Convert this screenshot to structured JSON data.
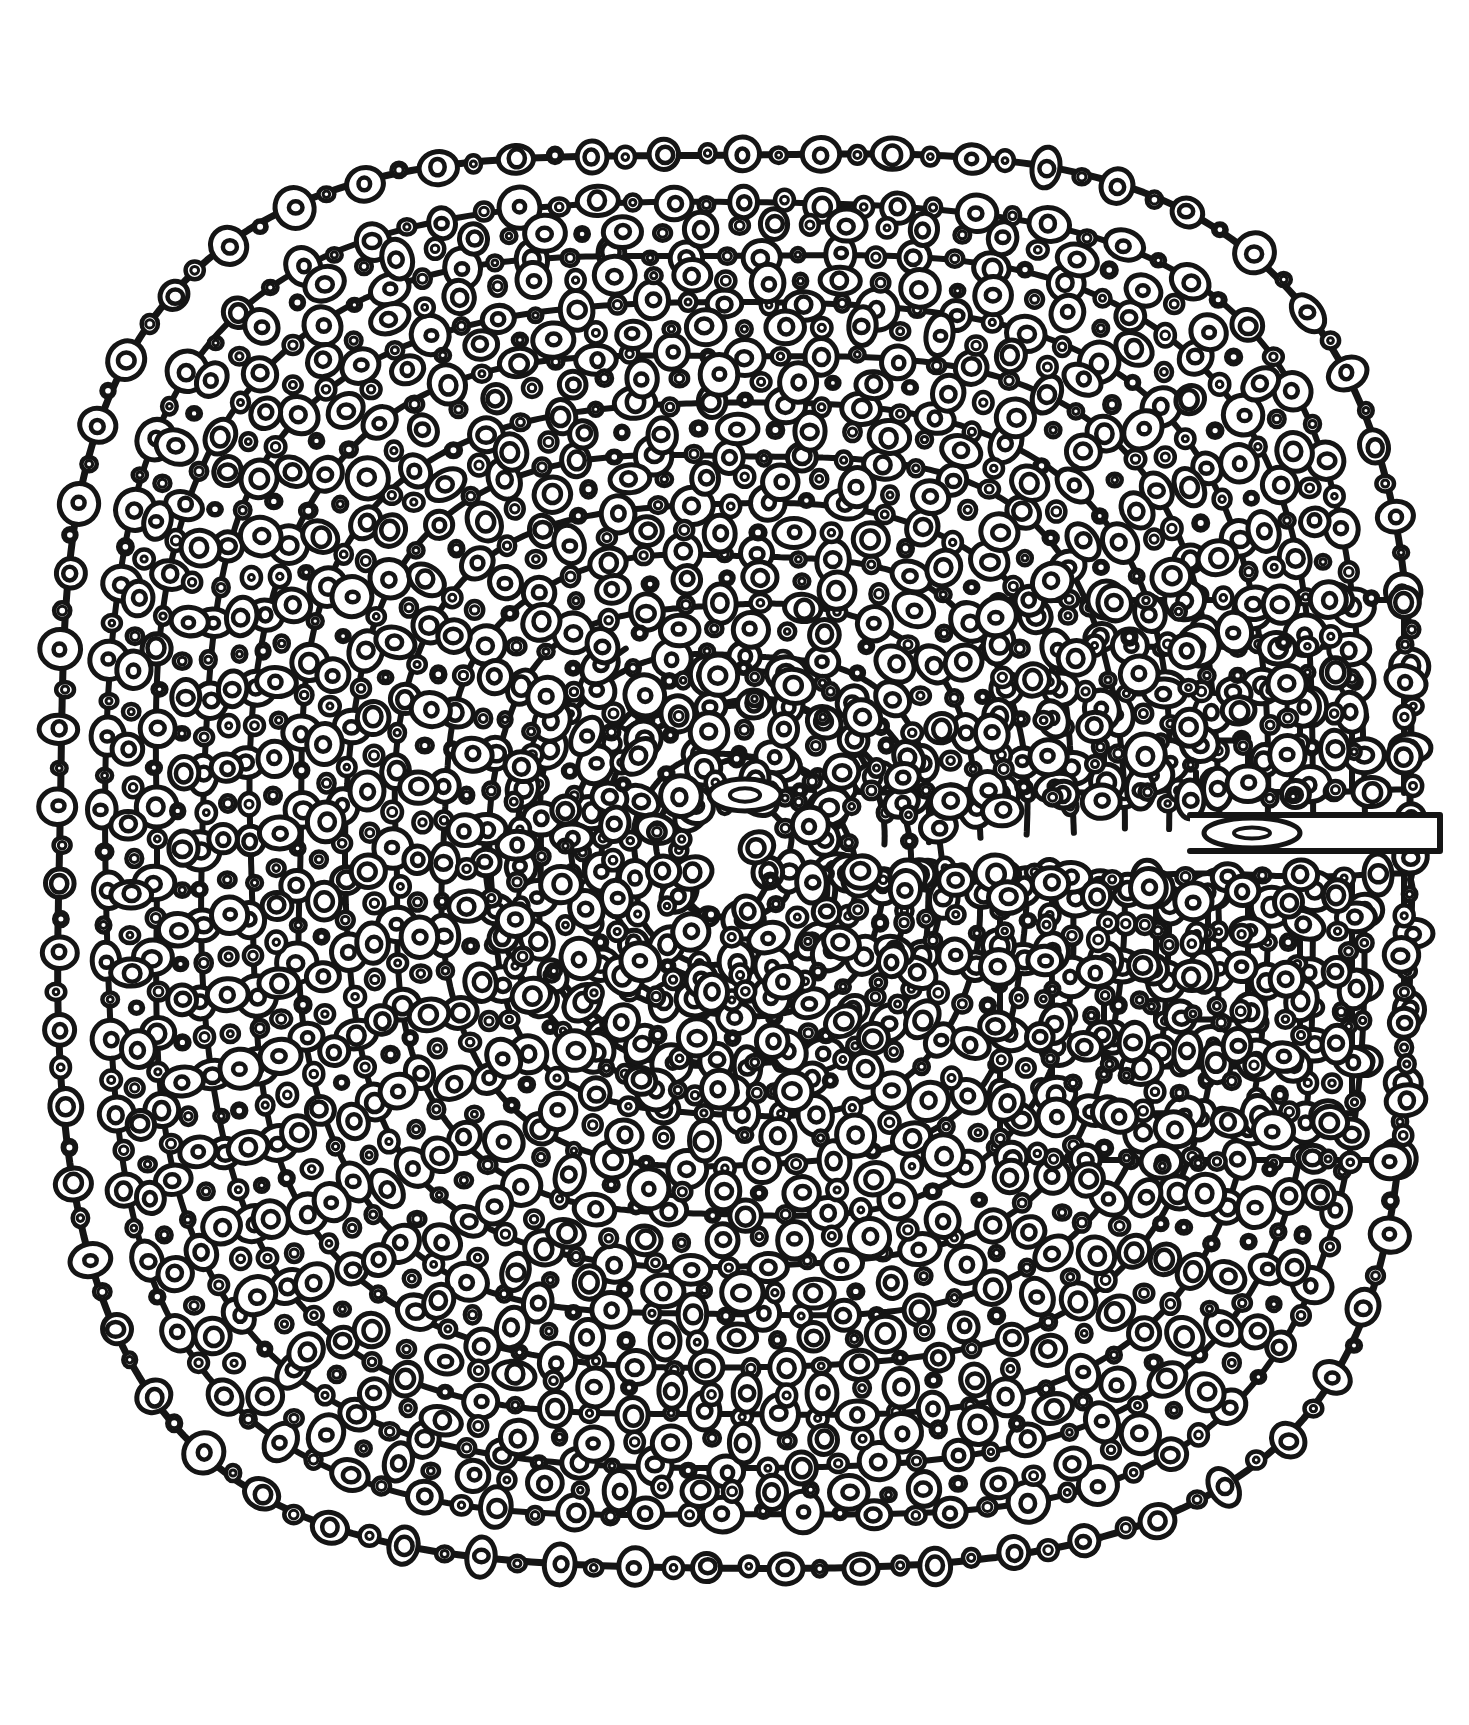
{
  "page": {
    "artwork_name": "Circle-Filled Spiral Labyrinth",
    "medium": "black ink line drawing on white",
    "canvas": {
      "width": 1469,
      "height": 1725,
      "background": "#ffffff"
    }
  },
  "palette": {
    "ink": "#151515",
    "paper": "#ffffff",
    "stroke_weight_outer": 7,
    "stroke_weight_wall": 6,
    "stroke_weight_motif": 5,
    "stroke_weight_motif_inner": 4.5
  },
  "figure": {
    "type": "labyrinth",
    "style": "Cretan / classical seed-pattern, squared-off on the right",
    "outline_shape": "rounded square (squircle)",
    "center_x": 735,
    "center_y": 860,
    "outer_bounds": {
      "left": 58,
      "top": 96,
      "right": 1412,
      "bottom": 1540
    },
    "ring_count": 14,
    "ring_spacing_px": 48,
    "entrance": {
      "side": "right",
      "label": "entrance-tab",
      "x": 1190,
      "y": 833,
      "width": 250,
      "height": 36,
      "marker": "elongated oval"
    },
    "goal": {
      "label": "center-goal-marker",
      "x": 745,
      "y": 795,
      "rx": 36,
      "ry": 16,
      "marker": "elongated oval with inner oval"
    }
  },
  "motif": {
    "name": "concentric circle chain",
    "description": "each wall band is filled with an alternating chain of large ringed circles and small circles",
    "large_circle_outer_r": 17,
    "large_circle_inner_r": 7,
    "small_circle_outer_r": 8,
    "small_circle_inner_r": 3.5,
    "ellipse_squash_min": 0.78,
    "ellipse_squash_max": 1.22,
    "spacing_px": 38,
    "jitter_px": 3.5
  },
  "chart_data": {
    "type": "diagram",
    "rings": [
      {
        "index": 0,
        "radius": 676,
        "label": "outer boundary"
      },
      {
        "index": 1,
        "radius": 628,
        "label": "wall 1"
      },
      {
        "index": 2,
        "radius": 580,
        "label": "wall 2"
      },
      {
        "index": 3,
        "radius": 532,
        "label": "wall 3"
      },
      {
        "index": 4,
        "radius": 484,
        "label": "wall 4"
      },
      {
        "index": 5,
        "radius": 436,
        "label": "wall 5"
      },
      {
        "index": 6,
        "radius": 388,
        "label": "wall 6"
      },
      {
        "index": 7,
        "radius": 340,
        "label": "wall 7"
      },
      {
        "index": 8,
        "radius": 292,
        "label": "wall 8"
      },
      {
        "index": 9,
        "radius": 244,
        "label": "wall 9"
      },
      {
        "index": 10,
        "radius": 196,
        "label": "wall 10"
      },
      {
        "index": 11,
        "radius": 148,
        "label": "wall 11"
      },
      {
        "index": 12,
        "radius": 100,
        "label": "wall 12"
      },
      {
        "index": 13,
        "radius": 56,
        "label": "wall 13 / inner spiral"
      }
    ],
    "right_turn_columns": [
      {
        "index": 0,
        "x": 1412,
        "top": 660,
        "bottom": 1060
      },
      {
        "index": 1,
        "x": 1364,
        "top": 660,
        "bottom": 1060
      },
      {
        "index": 2,
        "x": 1316,
        "top": 660,
        "bottom": 1060
      },
      {
        "index": 3,
        "x": 1268,
        "top": 660,
        "bottom": 1060
      },
      {
        "index": 4,
        "x": 1220,
        "top": 660,
        "bottom": 1060
      },
      {
        "index": 5,
        "x": 1172,
        "top": 660,
        "bottom": 1060
      },
      {
        "index": 6,
        "x": 1124,
        "top": 660,
        "bottom": 1060
      }
    ],
    "axis_on": false,
    "legend": false,
    "gridlines": false
  }
}
